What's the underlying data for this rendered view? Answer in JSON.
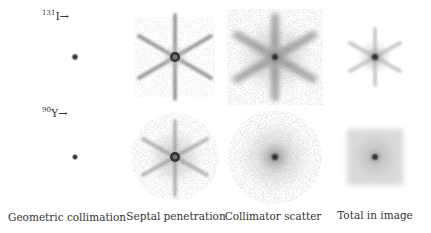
{
  "figure": {
    "rows": [
      {
        "isotope_mass": "131",
        "isotope_symbol": "I",
        "arrow": "→"
      },
      {
        "isotope_mass": "90",
        "isotope_symbol": "Y",
        "arrow": "→"
      }
    ],
    "columns": [
      {
        "label": "Geometric collimation"
      },
      {
        "label": "Septal penetration"
      },
      {
        "label": "Collimator scatter"
      },
      {
        "label": "Total in image"
      }
    ]
  }
}
